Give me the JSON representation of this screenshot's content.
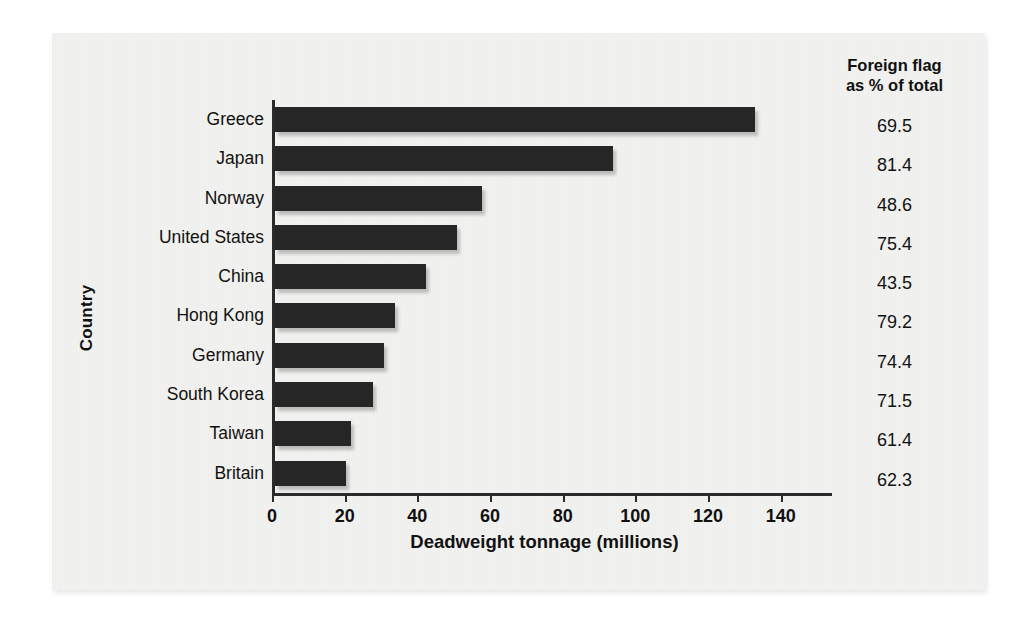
{
  "chart_data": {
    "type": "bar",
    "orientation": "horizontal",
    "title": "",
    "xlabel": "Deadweight tonnage (millions)",
    "ylabel": "Country",
    "xlim": [
      0,
      150
    ],
    "xticks": [
      0,
      20,
      40,
      60,
      80,
      100,
      120,
      140
    ],
    "xticklabels": [
      "0",
      "20",
      "40",
      "60",
      "80",
      "100",
      "120",
      "140"
    ],
    "grid": false,
    "legend": "none",
    "bar_color": "#262626",
    "categories": [
      "Greece",
      "Japan",
      "Norway",
      "United States",
      "China",
      "Hong Kong",
      "Germany",
      "South Korea",
      "Taiwan",
      "Britain"
    ],
    "values": [
      132,
      93,
      57,
      50,
      41.5,
      33,
      30,
      27,
      21,
      19.5
    ],
    "annotation_column": {
      "header": "Foreign flag\nas % of total",
      "values": [
        "69.5",
        "81.4",
        "48.6",
        "75.4",
        "43.5",
        "79.2",
        "74.4",
        "71.5",
        "61.4",
        "62.3"
      ]
    }
  },
  "axes": {
    "xlabel": "Deadweight tonnage (millions)",
    "ylabel": "Country"
  },
  "ticks": [
    {
      "value": "0"
    },
    {
      "value": "20"
    },
    {
      "value": "40"
    },
    {
      "value": "60"
    },
    {
      "value": "80"
    },
    {
      "value": "100"
    },
    {
      "value": "120"
    },
    {
      "value": "140"
    }
  ],
  "rows": [
    {
      "country": "Greece",
      "tonnage": 132,
      "pct": "69.5"
    },
    {
      "country": "Japan",
      "tonnage": 93,
      "pct": "81.4"
    },
    {
      "country": "Norway",
      "tonnage": 57,
      "pct": "48.6"
    },
    {
      "country": "United States",
      "tonnage": 50,
      "pct": "75.4"
    },
    {
      "country": "China",
      "tonnage": 41.5,
      "pct": "43.5"
    },
    {
      "country": "Hong Kong",
      "tonnage": 33,
      "pct": "79.2"
    },
    {
      "country": "Germany",
      "tonnage": 30,
      "pct": "74.4"
    },
    {
      "country": "South Korea",
      "tonnage": 27,
      "pct": "71.5"
    },
    {
      "country": "Taiwan",
      "tonnage": 21,
      "pct": "61.4"
    },
    {
      "country": "Britain",
      "tonnage": 19.5,
      "pct": "62.3"
    }
  ],
  "right_column": {
    "header_line1": "Foreign flag",
    "header_line2": "as % of total"
  }
}
